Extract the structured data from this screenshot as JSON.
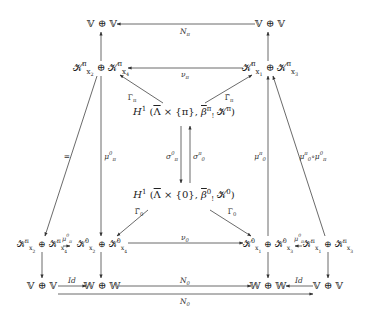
{
  "diagram": {
    "type": "commutative-diagram",
    "nodes": {
      "top_left": "𝕍 ⊕ 𝕍",
      "top_right": "𝕍 ⊕ 𝕍",
      "k_pi_left": "𝒦π_x2 ⊕ 𝒦π_x4",
      "k_pi_right": "𝒦π_x1 ⊕ 𝒦π_x3",
      "h1_pi": "H¹(Λ̄ × {π}, β̄π_! 𝒦π)",
      "h1_zero": "H¹(Λ̄ × {0}, β̄0_! 𝒦0)",
      "k_pi_far_left": "𝒦π_x2 ⊕ 𝒦π_x4",
      "k_zero_left": "𝒦0_x2 ⊕ 𝒦0_x4",
      "k_zero_right": "𝒦0_x1 ⊕ 𝒦0_x3",
      "k_pi_far_right": "𝒦π_x1 ⊕ 𝒦π_x3",
      "bottom_v_left": "𝕍 ⊕ 𝕍",
      "bottom_w_left": "𝕎 ⊕ 𝕎",
      "bottom_w_right": "𝕎 ⊕ 𝕎",
      "bottom_v_right": "𝕍 ⊕ 𝕍"
    },
    "labels": {
      "N_pi": "N",
      "N_pi_sub": "π",
      "nu_pi": "ν",
      "nu_pi_sub": "π",
      "Gamma_pi": "Γ",
      "Gamma_pi_sub": "π",
      "Gamma_pi_tilde": "Γ̃",
      "Gamma_pi_tilde_sub": "π",
      "equals": "=",
      "mu_pi_0": "μ",
      "mu_pi_0_sup": "0",
      "mu_pi_0_sub": "π",
      "sigma_pi_0": "σ",
      "sigma_pi_0_sup": "0",
      "sigma_pi_0_sub": "π",
      "sigma_0_pi": "σ",
      "sigma_0_pi_sup": "π",
      "sigma_0_pi_sub": "0",
      "mu_0_pi": "μ",
      "mu_0_pi_sup": "π",
      "mu_0_pi_sub": "0",
      "mu_comp": "μ",
      "mu_comp_a_sup": "π",
      "mu_comp_a_sub": "0",
      "mu_comp_circ": "∘μ",
      "mu_comp_b_sup": "0",
      "mu_comp_b_sub": "π",
      "Gamma_0_tilde": "Γ̃",
      "Gamma_0_tilde_sub": "0",
      "Gamma_0": "Γ",
      "Gamma_0_sub": "0",
      "nu_0": "ν",
      "nu_0_sub": "0",
      "mu_left_small": "μ",
      "mu_left_small_sup": "0",
      "mu_left_small_sub": "π",
      "mu_right_small": "μ",
      "mu_right_small_sup": "0",
      "mu_right_small_sub": "π",
      "Id_left": "Id",
      "Id_right": "Id",
      "N0_mid": "N",
      "N0_mid_sub": "0",
      "N0_bottom": "N",
      "N0_bottom_sub": "0"
    }
  }
}
